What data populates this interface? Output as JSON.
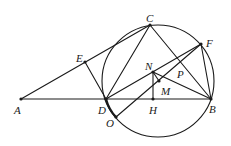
{
  "diagram": {
    "labels": {
      "A": "A",
      "B": "B",
      "C": "C",
      "D": "D",
      "E": "E",
      "F": "F",
      "H": "H",
      "M": "M",
      "N": "N",
      "O": "O",
      "P": "P"
    },
    "colors": {
      "ink": "#1a1a1a",
      "background": "#ffffff"
    }
  }
}
